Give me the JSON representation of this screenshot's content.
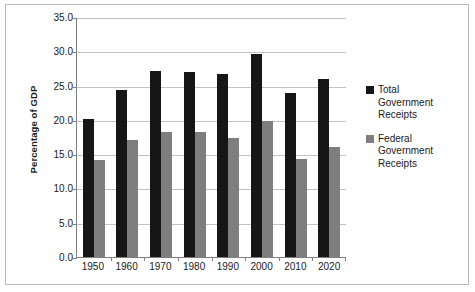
{
  "chart_data": {
    "type": "bar",
    "title": "",
    "subtitle": "",
    "xlabel": "",
    "ylabel": "Percentage of GDP",
    "categories": [
      "1950",
      "1960",
      "1970",
      "1980",
      "1990",
      "2000",
      "2010",
      "2020"
    ],
    "series": [
      {
        "name": "Total Government Receipts",
        "color": "#161616",
        "values": [
          20.2,
          24.4,
          27.2,
          27.0,
          26.7,
          29.6,
          23.9,
          26.0
        ]
      },
      {
        "name": "Federal Government Receipts",
        "color": "#7e7e7e",
        "values": [
          14.1,
          17.0,
          18.2,
          18.2,
          17.3,
          19.9,
          14.3,
          16.0
        ]
      }
    ],
    "ylim": [
      0.0,
      35.0
    ],
    "ytick_values": [
      0.0,
      5.0,
      10.0,
      15.0,
      20.0,
      25.0,
      30.0,
      35.0
    ],
    "ytick_labels": [
      "0.0",
      "5.0",
      "10.0",
      "15.0",
      "20.0",
      "25.0",
      "30.0",
      "35.0"
    ],
    "grid": "horizontal",
    "legend_position": "right",
    "legend_entries": [
      "Total\nGovernment\nReceipts",
      "Federal\nGovernment\nReceipts"
    ]
  },
  "colors": {
    "series_total": "#161616",
    "series_federal": "#7e7e7e",
    "gridline": "#c3c3c3",
    "axis": "#808080",
    "border": "#b9b9b9",
    "text": "#1a1a1a",
    "background": "#ffffff"
  }
}
